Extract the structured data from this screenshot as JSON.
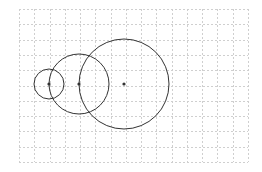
{
  "diagram": {
    "title": "",
    "grid": {
      "x": 19,
      "y": 9,
      "width": 229,
      "height": 153,
      "columns": 15,
      "rows": 10,
      "line_color": "#cfcfcf",
      "dash": "2,2"
    },
    "circles": [
      {
        "id": "small",
        "cx": 49,
        "cy": 84,
        "r": 15,
        "stroke": "#333333"
      },
      {
        "id": "medium",
        "cx": 79,
        "cy": 84,
        "r": 30,
        "stroke": "#333333"
      },
      {
        "id": "large",
        "cx": 124,
        "cy": 84,
        "r": 45,
        "stroke": "#333333"
      }
    ],
    "points": [
      {
        "id": "center-small",
        "x": 49,
        "y": 84,
        "color": "#333333"
      },
      {
        "id": "center-medium",
        "x": 79,
        "y": 84,
        "color": "#333333"
      },
      {
        "id": "center-large",
        "x": 124,
        "y": 84,
        "color": "#333333"
      }
    ]
  }
}
